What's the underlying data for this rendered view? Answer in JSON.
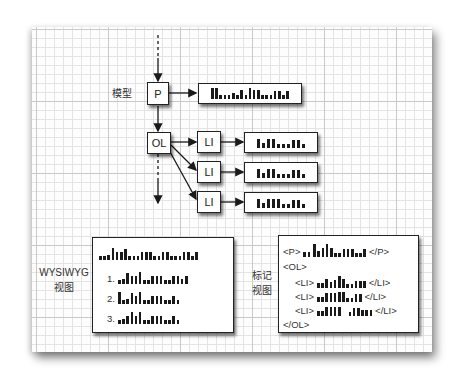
{
  "diagram": {
    "model_label": "模型",
    "nodes": {
      "p": "P",
      "ol": "OL",
      "li": [
        "LI",
        "LI",
        "LI"
      ]
    },
    "wysiwyg_label": [
      "WYSIWYG",
      "视图"
    ],
    "markup_label": [
      "标记",
      "视图"
    ],
    "wysiwyg_list_numbers": [
      "1.",
      "2.",
      "3."
    ],
    "markup_lines": {
      "p_open": "<P>",
      "p_close": "</P>",
      "ol_open": "<OL>",
      "ol_close": "</OL>",
      "li_open": "<LI>",
      "li_close": "</LI>"
    },
    "colors": {
      "ink": "#1a1a1a",
      "grid_minor": "#e4e4e4",
      "grid_major": "#c9c9c9",
      "box_fill": "#ffffff"
    }
  }
}
